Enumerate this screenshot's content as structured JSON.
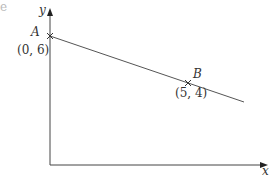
{
  "diagram": {
    "axes": {
      "x_label": "x",
      "y_label": "y"
    },
    "points": [
      {
        "name": "A",
        "coords": "(0, 6)"
      },
      {
        "name": "B",
        "coords": "(5, 4)"
      }
    ],
    "edge_fragment": "e",
    "colors": {
      "line": "#444444",
      "text": "#333333"
    }
  }
}
